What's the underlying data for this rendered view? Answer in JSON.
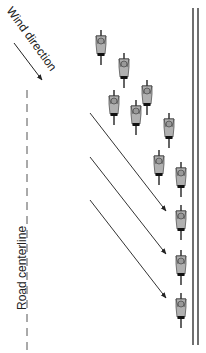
{
  "labels": {
    "wind_direction": "Wind direction",
    "road_centerline": "Road centerline"
  },
  "colors": {
    "line": "#333333",
    "cyclist_body": "#b0b0b0",
    "cyclist_dark": "#111111",
    "background": "#ffffff"
  },
  "wind_arrow": {
    "x1": 14,
    "y1": 43,
    "x2": 42,
    "y2": 80
  },
  "centerline": {
    "x": 27,
    "y1": 90,
    "y2": 350,
    "dash": "8,6"
  },
  "road_edge": {
    "x_lines": [
      193,
      198
    ],
    "y1": 8,
    "y2": 345
  },
  "drift_arrows": [
    {
      "x1": 90,
      "y1": 113,
      "x2": 166,
      "y2": 211
    },
    {
      "x1": 90,
      "y1": 157,
      "x2": 166,
      "y2": 254
    },
    {
      "x1": 90,
      "y1": 200,
      "x2": 166,
      "y2": 298
    }
  ],
  "cyclists": [
    {
      "x": 101,
      "y": 30
    },
    {
      "x": 124,
      "y": 53
    },
    {
      "x": 147,
      "y": 80
    },
    {
      "x": 114,
      "y": 90
    },
    {
      "x": 136,
      "y": 100
    },
    {
      "x": 169,
      "y": 113
    },
    {
      "x": 159,
      "y": 150
    },
    {
      "x": 181,
      "y": 162
    },
    {
      "x": 181,
      "y": 205
    },
    {
      "x": 181,
      "y": 250
    },
    {
      "x": 181,
      "y": 293
    }
  ]
}
